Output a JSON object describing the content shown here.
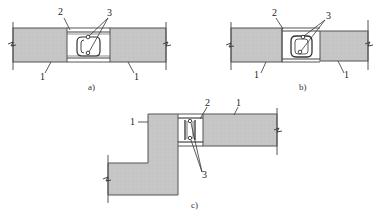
{
  "figure": {
    "panels": [
      {
        "id": "a",
        "caption": "a)",
        "labels": {
          "joint_rebar": "2",
          "longitudinal_bars": "3",
          "left_slab": "1",
          "right_slab": "1"
        }
      },
      {
        "id": "b",
        "caption": "b)",
        "labels": {
          "joint_rebar": "2",
          "longitudinal_bars": "3",
          "left_slab": "1",
          "right_slab": "1"
        }
      },
      {
        "id": "c",
        "caption": "c)",
        "labels": {
          "left_slab": "1",
          "joint_rebar": "2",
          "right_slab": "1",
          "longitudinal_bars": "3"
        }
      }
    ],
    "colors": {
      "concrete_fill": "#c4c4c4",
      "outline": "#444444",
      "background": "#ffffff"
    }
  }
}
